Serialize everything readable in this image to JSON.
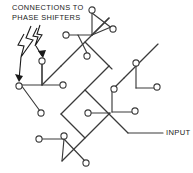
{
  "figure": {
    "background_color": "#ffffff",
    "line_color": "#3a3a3a",
    "text_color": "#1a1a1a",
    "width": 193,
    "height": 173
  },
  "annotations": {
    "phase_shifters": {
      "line1": "CONNECTIONS TO",
      "line2": "PHASE SHIFTERS",
      "text": "CONNECTIONS TO\nPHASE SHIFTERS"
    },
    "input": {
      "text": "INPUT"
    }
  },
  "diagram_data": {
    "type": "tree-network",
    "description": "Binary corporate feed: input trunk splits through 4 levels of 45-degree T-junctions into 16 circular output ports connected to phase shifters.",
    "node_count": 16,
    "node_radius": 3.1,
    "nodes": [
      {
        "id": "p1",
        "x": 19,
        "y": 86
      },
      {
        "id": "p2",
        "x": 41,
        "y": 113
      },
      {
        "id": "p3",
        "x": 42,
        "y": 61
      },
      {
        "id": "p4",
        "x": 63,
        "y": 85
      },
      {
        "id": "p5",
        "x": 66,
        "y": 35
      },
      {
        "id": "p6",
        "x": 87,
        "y": 56
      },
      {
        "id": "p7",
        "x": 92,
        "y": 10
      },
      {
        "id": "p8",
        "x": 113,
        "y": 29
      },
      {
        "id": "p9",
        "x": 39,
        "y": 139
      },
      {
        "id": "p10",
        "x": 64,
        "y": 136
      },
      {
        "id": "p11",
        "x": 86,
        "y": 163
      },
      {
        "id": "p12",
        "x": 88,
        "y": 113
      },
      {
        "id": "p13",
        "x": 114,
        "y": 89
      },
      {
        "id": "p14",
        "x": 135,
        "y": 111
      },
      {
        "id": "p15",
        "x": 136,
        "y": 63
      },
      {
        "id": "p16",
        "x": 157,
        "y": 87
      }
    ],
    "leader_arrows": [
      {
        "from_x": 30,
        "from_y": 26,
        "to_x": 20,
        "to_y": 81
      },
      {
        "from_x": 44,
        "from_y": 26,
        "to_x": 43,
        "to_y": 56
      }
    ],
    "input_leader": {
      "from_x": 128,
      "from_y": 133,
      "to_x": 163,
      "to_y": 133
    }
  }
}
